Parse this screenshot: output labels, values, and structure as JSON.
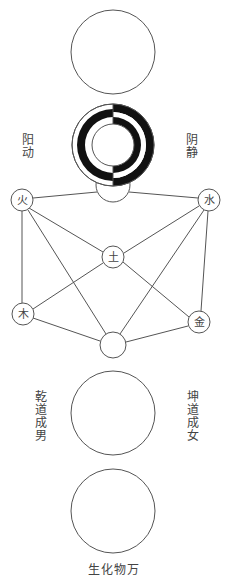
{
  "labels": {
    "yang_dong": "阳动",
    "yin_jing": "阴静",
    "qian_dao": "乾道成男",
    "kun_dao": "坤道成女",
    "wanwu": "生化物万"
  },
  "nodes": {
    "fire": "火",
    "water": "水",
    "earth": "土",
    "wood": "木",
    "metal": "金"
  },
  "colors": {
    "line": "#555555",
    "fill_black": "#111111",
    "text": "#444444"
  }
}
